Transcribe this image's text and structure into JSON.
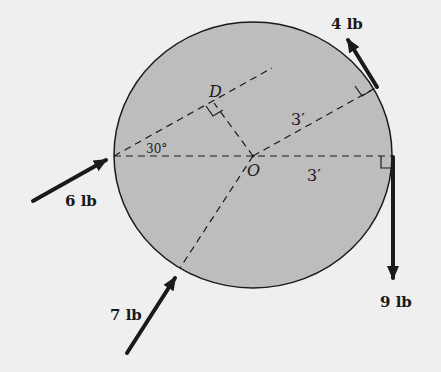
{
  "figure": {
    "center_label": "O",
    "foot_label": "D",
    "angle_label": "30°",
    "dimensions": [
      {
        "label": "3′",
        "position": "upper"
      },
      {
        "label": "3′",
        "position": "lower"
      }
    ],
    "forces": [
      {
        "label": "4 lb",
        "location": "upper-right tangent"
      },
      {
        "label": "6 lb",
        "location": "left"
      },
      {
        "label": "7 lb",
        "location": "lower-left"
      },
      {
        "label": "9 lb",
        "location": "right, downward"
      }
    ],
    "colors": {
      "disk_fill": "#bdbdbd",
      "background": "#efefef",
      "lines": "#1a1a1a"
    }
  }
}
